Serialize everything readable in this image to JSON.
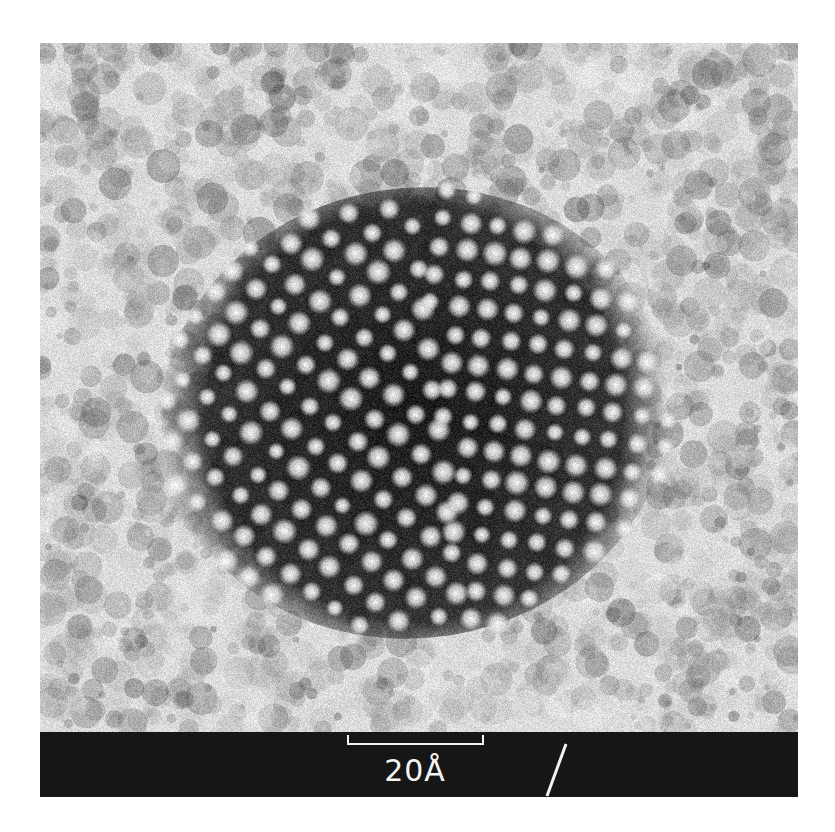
{
  "figure": {
    "type": "HRTEM micrograph",
    "colors": {
      "background_light": "#e6e6e6",
      "background_dark": "#3a3a3a",
      "lattice_dark": "#141414",
      "lattice_spot": "#f4f4f4",
      "scale_band": "#161616",
      "scale_ink": "#f2f2f2"
    },
    "crystal": {
      "center": [
        375,
        370
      ],
      "radius": [
        255,
        225
      ],
      "domains": [
        {
          "name": "left-domain",
          "spacing": 29,
          "angle_deg": 38,
          "side": "left"
        },
        {
          "name": "right-domain",
          "spacing": 28,
          "angle_deg": 8,
          "side": "right"
        }
      ],
      "twin_boundary": {
        "from": [
          370,
          110
        ],
        "to": [
          420,
          560
        ]
      }
    }
  },
  "scale_bar": {
    "label": "20Å",
    "length_px": 137,
    "represents": "20 Å"
  },
  "annotation": {
    "mark": "/"
  }
}
